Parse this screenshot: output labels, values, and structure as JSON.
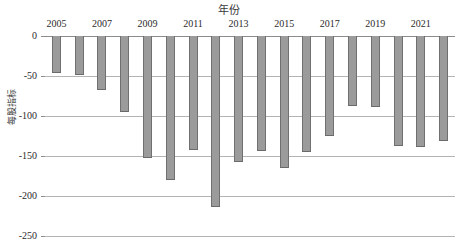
{
  "chart_data": {
    "type": "bar",
    "title": "年份",
    "xlabel": "年份",
    "ylabel": "每股指标",
    "categories": [
      "2005",
      "2006",
      "2007",
      "2008",
      "2009",
      "2010",
      "2011",
      "2012",
      "2013",
      "2014",
      "2015",
      "2016",
      "2017",
      "2018",
      "2019",
      "2020",
      "2021",
      "2022"
    ],
    "values": [
      -46,
      -49,
      -68,
      -95,
      -153,
      -180,
      -143,
      -214,
      -158,
      -144,
      -165,
      -145,
      -125,
      -88,
      -89,
      -138,
      -139,
      -131
    ],
    "x_tick_labels": [
      "2005",
      "2007",
      "2009",
      "2011",
      "2013",
      "2015",
      "2017",
      "2019",
      "2021"
    ],
    "y_tick_labels": [
      "0",
      "-50",
      "-100",
      "-150",
      "-200",
      "-250"
    ],
    "y_tick_values": [
      0,
      -50,
      -100,
      -150,
      -200,
      -250
    ],
    "ylim": [
      -250,
      0
    ],
    "grid": true,
    "legend": "none",
    "bar_color": "#9b9b9b",
    "bar_edge_color": "#707070",
    "gridline_color": "#b4b4b4",
    "axis_color": "#8c8c8c",
    "background": "#ffffff"
  }
}
